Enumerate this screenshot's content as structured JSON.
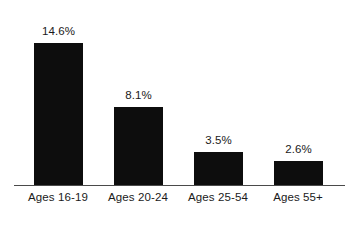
{
  "chart_data": {
    "type": "bar",
    "title": "",
    "subtitle": "",
    "xlabel": "",
    "ylabel": "",
    "categories": [
      "Ages 16-19",
      "Ages 20-24",
      "Ages 25-54",
      "Ages 55+"
    ],
    "values": [
      14.6,
      8.1,
      3.5,
      2.6
    ],
    "value_labels": [
      "14.6%",
      "8.1%",
      "3.5%",
      "2.6%"
    ],
    "unit": "%",
    "ylim": [
      0,
      19
    ],
    "grid": false,
    "legend": null,
    "legend_position": "none",
    "annotations": [],
    "axis": {
      "x_axis_visible": true,
      "y_axis_visible": false,
      "tick_labels_y": []
    },
    "colors": {
      "bar": "#0d0d0d",
      "background": "#ffffff",
      "text": "#1a1a1a",
      "axis": "#4a4a4a"
    }
  },
  "layout": {
    "bar_width_px": 49,
    "bar_pitch_px": 80,
    "first_bar_left_px": 34,
    "baseline_y_px": 185,
    "px_per_percent": 9.8
  }
}
